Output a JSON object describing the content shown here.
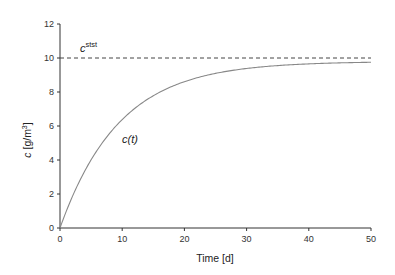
{
  "chart_data": {
    "type": "line",
    "title": "",
    "xlabel": "Time [d]",
    "ylabel_main": "c",
    "ylabel_unit": "[g/m",
    "ylabel_sup": "3",
    "ylabel_close": "]",
    "xlim": [
      0,
      50
    ],
    "ylim": [
      0,
      12
    ],
    "xticks": [
      0,
      10,
      20,
      30,
      40,
      50
    ],
    "yticks": [
      0,
      2,
      4,
      6,
      8,
      10,
      12
    ],
    "grid": false,
    "legend": null,
    "series": [
      {
        "name": "c(t)",
        "style": "solid",
        "color": "#888888",
        "model": "c(t) = 9.8 * (1 - exp(-t/9.5))",
        "x": [
          0,
          2.5,
          5,
          7.5,
          10,
          12.5,
          15,
          17.5,
          20,
          25,
          30,
          35,
          40,
          45,
          50
        ],
        "values": [
          0,
          2.25,
          4.0,
          5.35,
          6.43,
          7.26,
          7.91,
          8.4,
          8.62,
          9.1,
          9.39,
          9.57,
          9.66,
          9.72,
          9.75
        ]
      },
      {
        "name": "c_stst",
        "style": "dashed",
        "color": "#444444",
        "x": [
          0,
          50
        ],
        "values": [
          10,
          10
        ]
      }
    ],
    "annotations": [
      {
        "text_main": "c",
        "text_sup": "stst",
        "x": 1.2,
        "y": 10.35
      },
      {
        "text_main": "c(",
        "text_italic": "t",
        "text_close": ")",
        "x": 9.8,
        "y": 5.6
      }
    ]
  }
}
